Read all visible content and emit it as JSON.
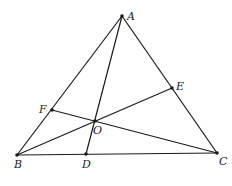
{
  "figure": {
    "type": "triangle-with-cevians",
    "stroke_color": "#1a1a1a",
    "points": {
      "A": {
        "label": "A",
        "x": 122,
        "y": 16,
        "lx": 127,
        "ly": 20
      },
      "B": {
        "label": "B",
        "x": 17,
        "y": 155,
        "lx": 14,
        "ly": 168
      },
      "C": {
        "label": "C",
        "x": 217,
        "y": 153,
        "lx": 219,
        "ly": 165
      },
      "D": {
        "label": "D",
        "x": 86,
        "y": 154,
        "lx": 82,
        "ly": 168
      },
      "E": {
        "label": "E",
        "x": 172,
        "y": 88,
        "lx": 176,
        "ly": 90
      },
      "F": {
        "label": "F",
        "x": 52,
        "y": 110,
        "lx": 39,
        "ly": 113
      },
      "O": {
        "label": "O",
        "x": 95,
        "y": 121,
        "lx": 93,
        "ly": 134
      }
    },
    "segments": [
      [
        "A",
        "B"
      ],
      [
        "B",
        "C"
      ],
      [
        "C",
        "A"
      ],
      [
        "A",
        "D"
      ],
      [
        "B",
        "E"
      ],
      [
        "C",
        "F"
      ]
    ]
  }
}
